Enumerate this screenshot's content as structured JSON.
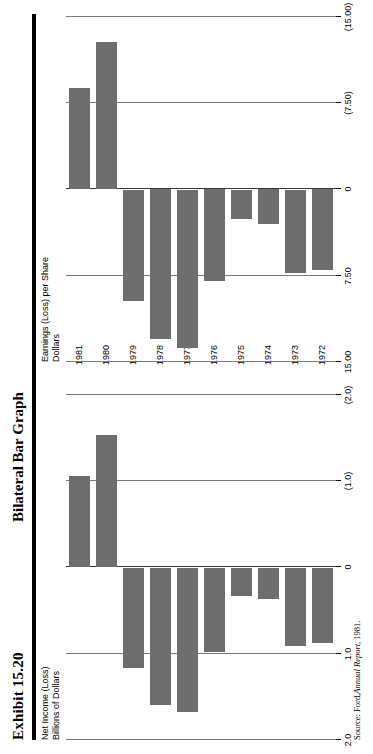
{
  "header": {
    "exhibit_number": "Exhibit 15.20",
    "exhibit_title": "Bilateral Bar Graph"
  },
  "source_note": {
    "prefix": "Source:",
    "publisher": "Ford,",
    "work": "Annual Report",
    "year": ", 1981."
  },
  "colors": {
    "bar_fill": "#6e6e6e",
    "gridline": "#7d7d7d",
    "zero_axis": "#3a3a3a",
    "rule": "#000000"
  },
  "chart_data": [
    {
      "id": "net-income",
      "type": "bar",
      "orientation": "horizontal-bilateral",
      "title": "Net Income (Loss)",
      "ylabel": "Billions of Dollars",
      "xlabel": "",
      "categories": [
        "1972",
        "1973",
        "1974",
        "1975",
        "1976",
        "1977",
        "1978",
        "1979",
        "1980",
        "1981"
      ],
      "values": [
        0.87,
        0.91,
        0.36,
        0.33,
        0.98,
        1.67,
        1.59,
        1.17,
        -1.54,
        -1.06
      ],
      "tick_values": [
        2.0,
        1.0,
        0,
        -1.0,
        -2.0
      ],
      "tick_labels": [
        "2.0",
        "1.0",
        "0",
        "(1.0)",
        "(2.0)"
      ],
      "xlim": [
        2.0,
        -2.0
      ],
      "grid": true,
      "legend": "none"
    },
    {
      "id": "earnings-per-share",
      "type": "bar",
      "orientation": "horizontal-bilateral",
      "title": "Earnings (Loss) per Share",
      "ylabel": "Dollars",
      "xlabel": "",
      "categories": [
        "1972",
        "1973",
        "1974",
        "1975",
        "1976",
        "1977",
        "1978",
        "1979",
        "1980",
        "1981"
      ],
      "values": [
        7.0,
        7.3,
        3.0,
        2.6,
        8.0,
        13.8,
        13.0,
        9.7,
        -12.8,
        -8.8
      ],
      "tick_values": [
        15.0,
        7.5,
        0,
        -7.5,
        -15.0
      ],
      "tick_labels": [
        "15.00",
        "7.50",
        "0",
        "(7.50)",
        "(15.00)"
      ],
      "xlim": [
        15.0,
        -15.0
      ],
      "grid": true,
      "legend": "none"
    }
  ]
}
